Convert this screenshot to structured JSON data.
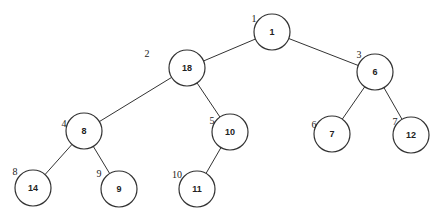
{
  "diagram": {
    "type": "binary-tree",
    "nodes": [
      {
        "index": "1",
        "value": "1",
        "cx": 272,
        "cy": 32,
        "lx": 254,
        "ly": 18
      },
      {
        "index": "2",
        "value": "18",
        "cx": 187,
        "cy": 68,
        "lx": 147,
        "ly": 53
      },
      {
        "index": "3",
        "value": "6",
        "cx": 375,
        "cy": 72,
        "lx": 359,
        "ly": 54
      },
      {
        "index": "4",
        "value": "8",
        "cx": 84,
        "cy": 131,
        "lx": 64,
        "ly": 123
      },
      {
        "index": "5",
        "value": "10",
        "cx": 230,
        "cy": 132,
        "lx": 212,
        "ly": 120
      },
      {
        "index": "6",
        "value": "7",
        "cx": 332,
        "cy": 134,
        "lx": 314,
        "ly": 124
      },
      {
        "index": "7",
        "value": "12",
        "cx": 411,
        "cy": 135,
        "lx": 395,
        "ly": 121
      },
      {
        "index": "8",
        "value": "14",
        "cx": 33,
        "cy": 188,
        "lx": 15,
        "ly": 171
      },
      {
        "index": "9",
        "value": "9",
        "cx": 119,
        "cy": 189,
        "lx": 99,
        "ly": 173
      },
      {
        "index": "10",
        "value": "11",
        "cx": 197,
        "cy": 189,
        "lx": 177,
        "ly": 174
      }
    ],
    "edges": [
      [
        0,
        1
      ],
      [
        0,
        2
      ],
      [
        1,
        3
      ],
      [
        1,
        4
      ],
      [
        2,
        5
      ],
      [
        2,
        6
      ],
      [
        3,
        7
      ],
      [
        3,
        8
      ],
      [
        4,
        9
      ]
    ],
    "node_radius": 18,
    "colors": {
      "stroke": "#333333",
      "fill": "#ffffff",
      "text": "#222222"
    }
  }
}
